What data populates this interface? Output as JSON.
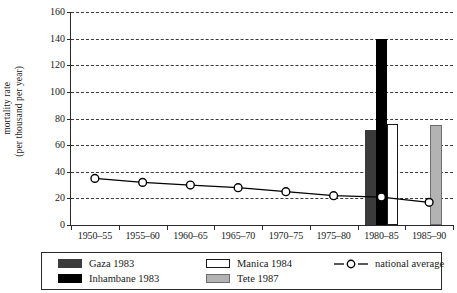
{
  "chart_data": {
    "type": "bar",
    "title": "",
    "xlabel": "",
    "ylabel_line1": "mortality rate",
    "ylabel_line2": "(per thousand per year)",
    "categories": [
      "1950–55",
      "1955–60",
      "1960–65",
      "1965–70",
      "1970–75",
      "1975–80",
      "1980–85",
      "1985–90"
    ],
    "ylim": [
      0,
      160
    ],
    "yticks": [
      0,
      20,
      40,
      60,
      80,
      100,
      120,
      140,
      160
    ],
    "grid": "horizontal-dashed",
    "legend_position": "below-plot-boxed",
    "series": [
      {
        "name": "national average",
        "type": "line",
        "marker": "open-circle",
        "color": "#000000",
        "x": [
          "1950–55",
          "1955–60",
          "1960–65",
          "1965–70",
          "1970–75",
          "1975–80",
          "1980–85",
          "1985–90"
        ],
        "values": [
          35,
          32,
          30,
          28,
          25,
          22,
          21,
          17
        ]
      },
      {
        "name": "Gaza 1983",
        "type": "bar",
        "color": "#3b3b3b",
        "category": "1980–85",
        "value": 71
      },
      {
        "name": "Inhambane 1983",
        "type": "bar",
        "color": "#000000",
        "category": "1980–85",
        "value": 140
      },
      {
        "name": "Manica 1984",
        "type": "bar",
        "color": "#ffffff",
        "category": "1980–85",
        "value": 76
      },
      {
        "name": "Tete 1987",
        "type": "bar",
        "color": "#b3b3b3",
        "category": "1985–90",
        "value": 75
      }
    ]
  },
  "axis": {
    "y_tick_labels": [
      "0",
      "20",
      "40",
      "60",
      "80",
      "100",
      "120",
      "140",
      "160"
    ],
    "x_tick_labels": [
      "1950–55",
      "1955–60",
      "1960–65",
      "1965–70",
      "1970–75",
      "1975–80",
      "1980–85",
      "1985–90"
    ],
    "ylabel_line1": "mortality rate",
    "ylabel_line2": "(per thousand per year)"
  },
  "legend": {
    "items": [
      {
        "label": "Gaza 1983",
        "swatch": "dark-gray-filled"
      },
      {
        "label": "Inhambane 1983",
        "swatch": "black-filled"
      },
      {
        "label": "Manica 1984",
        "swatch": "white-outlined"
      },
      {
        "label": "Tete 1987",
        "swatch": "light-gray-filled"
      },
      {
        "label": "national average",
        "swatch": "line-with-open-circle"
      }
    ]
  },
  "colors": {
    "gaza": "#3b3b3b",
    "inhambane": "#000000",
    "manica": "#ffffff",
    "tete": "#b3b3b3",
    "axis": "#2a2a2a",
    "grid": "#3a3a3a"
  }
}
